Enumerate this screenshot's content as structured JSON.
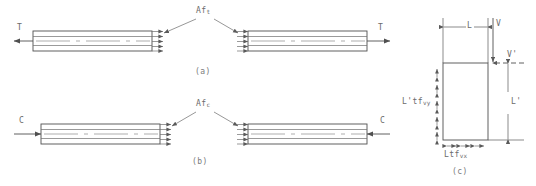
{
  "figure": {
    "panels": [
      {
        "id": "a",
        "caption": "(a)",
        "force_label_left": "T",
        "force_label_right": "T",
        "transfer_label_base": "Af",
        "transfer_label_sub": "t",
        "transfer_label_full": "Af t",
        "description": "tension lap splice force transfer",
        "bar_count": 2,
        "transfer_arrow_count": 4
      },
      {
        "id": "b",
        "caption": "(b)",
        "force_label_left": "C",
        "force_label_right": "C",
        "transfer_label_base": "Af",
        "transfer_label_sub": "c",
        "transfer_label_full": "Af c",
        "description": "compression lap splice force transfer",
        "bar_count": 2,
        "transfer_arrow_count": 4
      },
      {
        "id": "c",
        "caption": "(c)",
        "description": "shear panel with dimensions and shear flow",
        "dim_top": "L",
        "dim_right": "L'",
        "force_top": "V",
        "force_right": "V'",
        "shear_left_base": "L'tf",
        "shear_left_sub": "vy",
        "shear_left_full": "L'tf vy",
        "shear_bottom_base": "Ltf",
        "shear_bottom_sub": "vx",
        "shear_bottom_full": "Ltf vx",
        "left_arrow_count": 5,
        "bottom_arrow_count": 3
      }
    ]
  },
  "colors": {
    "line": "#4f4f4f",
    "thin_line": "#6e6e6e",
    "center_line": "#8a8a8a",
    "text": "#6b6b6b",
    "background": "#ffffff"
  }
}
